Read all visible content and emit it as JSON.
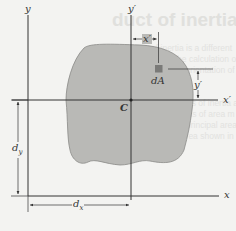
{
  "figure": {
    "background_text": {
      "heading": "duct of inertia for an area",
      "lines": [
        "moment of inertia is a different",
        "applications of the calculation of",
        "Steel section, the orientation of t",
        "and for the moments of inertia abo",
        "in our considerations of area m",
        "component of the principal area",
        "of inertia for this area shown in Fig. A"
      ]
    },
    "axes": {
      "x": "x",
      "y": "y",
      "x_prime": "x′",
      "y_prime": "y′"
    },
    "centroid_label": "C",
    "element_label": "dA",
    "dimensions": {
      "x_prime_offset": "x′",
      "y_prime_offset": "y′",
      "dx": "d",
      "dx_sub": "x",
      "dy": "d",
      "dy_sub": "y"
    },
    "colors": {
      "area_fill": "#b9b9b6",
      "area_outline": "#8a8a88",
      "element_fill": "#7a7a78",
      "axis": "#333333",
      "background": "#f3f3f1"
    }
  }
}
